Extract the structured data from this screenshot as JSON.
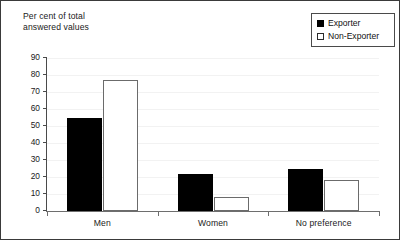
{
  "chart_data": {
    "type": "bar",
    "title": "",
    "ylabel": "Per cent of total\nanswered values",
    "xlabel": "",
    "categories": [
      "Men",
      "Women",
      "No preference"
    ],
    "series": [
      {
        "name": "Exporter",
        "values": [
          55,
          22,
          25
        ],
        "color": "#000000",
        "swatch": "filled"
      },
      {
        "name": "Non-Exporter",
        "values": [
          77,
          8,
          18
        ],
        "color": "#ffffff",
        "swatch": "hollow"
      }
    ],
    "ylim": [
      0,
      90
    ],
    "yticks": [
      90,
      80,
      70,
      60,
      50,
      40,
      30,
      20,
      10,
      0
    ],
    "ytick_labels": [
      "90",
      "80",
      "70",
      "60",
      "50",
      "40",
      "30",
      "20",
      "10",
      "0"
    ],
    "grid": false,
    "legend_position": "top-right",
    "legend_entries": [
      "Exporter",
      "Non-Exporter"
    ]
  },
  "figure": {
    "border_color": "#3a3a3a",
    "background": "#ffffff",
    "axis_color": "#4a4a4a"
  }
}
